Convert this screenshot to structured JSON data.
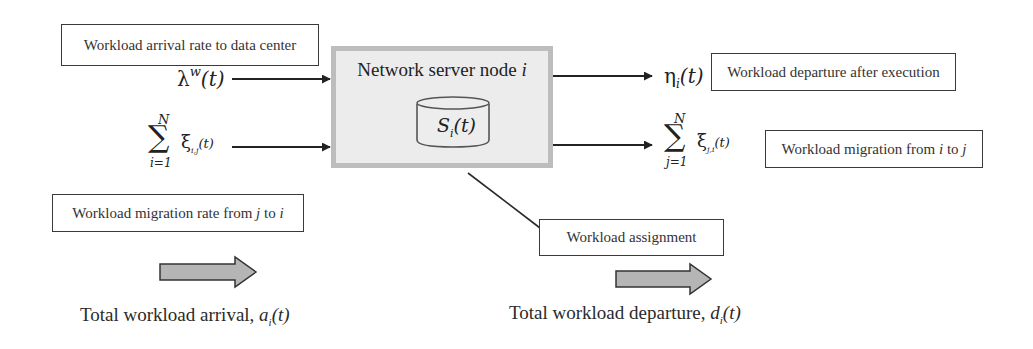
{
  "diagram": {
    "node": {
      "title": "Network server node i",
      "title_prefix": "Network server node ",
      "title_var": "i",
      "storage_label": "S",
      "storage_sub": "i",
      "storage_arg": "(t)"
    },
    "labels": {
      "arrival_rate": "Workload arrival rate to data center",
      "departure_exec": "Workload departure after execution",
      "migration_i_to_j": "Workload migration from i to j",
      "migration_i_to_j_prefix": "Workload migration from ",
      "migration_i_to_j_i": "i",
      "migration_i_to_j_mid": " to ",
      "migration_i_to_j_j": "j",
      "migration_j_to_i": "Workload migration rate from j to i",
      "migration_j_to_i_prefix": "Workload migration rate from ",
      "migration_j_to_i_j": "j",
      "migration_j_to_i_mid": " to ",
      "migration_j_to_i_i": "i",
      "assignment": "Workload assignment"
    },
    "inputs": {
      "lambda": {
        "symbol": "λ",
        "sup": "w",
        "arg": "(t)"
      },
      "sum_in": {
        "sigma": "∑",
        "upper": "N",
        "lower": "i=1",
        "symbol": "ξ",
        "sub": "i,j",
        "arg": "(t)"
      }
    },
    "outputs": {
      "eta": {
        "symbol": "η",
        "sub": "i",
        "arg": "(t)"
      },
      "sum_out": {
        "sigma": "∑",
        "upper": "N",
        "lower": "j=1",
        "symbol": "ξ",
        "sub": "j,i",
        "arg": "(t)"
      }
    },
    "captions": {
      "arrival_prefix": "Total workload arrival, ",
      "arrival_var": "a",
      "arrival_sub": "i",
      "arrival_arg": "(t)",
      "departure_prefix": "Total workload departure, ",
      "departure_var": "d",
      "departure_sub": "i",
      "departure_arg": "(t)"
    },
    "colors": {
      "node_fill": "#ececec",
      "node_border": "#bdbdbd",
      "block_arrow_fill": "#b5b5b5",
      "line": "#222222"
    }
  }
}
